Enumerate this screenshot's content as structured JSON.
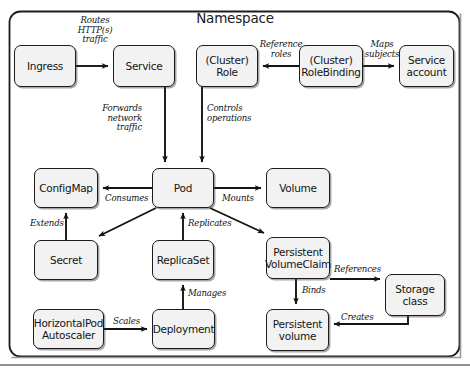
{
  "diagram": {
    "title": "Namespace",
    "colors": {
      "node_fill": "#f2f2f2",
      "node_border": "#1c1c1c",
      "arrow": "#141414",
      "background": "#ffffff"
    },
    "nodes": [
      {
        "id": "ingress",
        "label": "Ingress",
        "x": 14,
        "y": 45,
        "w": 62,
        "h": 42
      },
      {
        "id": "service",
        "label": "Service",
        "x": 113,
        "y": 45,
        "w": 62,
        "h": 42
      },
      {
        "id": "role",
        "label": "(Cluster)\nRole",
        "x": 196,
        "y": 45,
        "w": 62,
        "h": 42
      },
      {
        "id": "rolebinding",
        "label": "(Cluster)\nRoleBinding",
        "x": 299,
        "y": 45,
        "w": 64,
        "h": 42
      },
      {
        "id": "serviceaccount",
        "label": "Service\naccount",
        "x": 399,
        "y": 45,
        "w": 55,
        "h": 42
      },
      {
        "id": "configmap",
        "label": "ConfigMap",
        "x": 34,
        "y": 168,
        "w": 64,
        "h": 40
      },
      {
        "id": "pod",
        "label": "Pod",
        "x": 152,
        "y": 168,
        "w": 62,
        "h": 40
      },
      {
        "id": "volume",
        "label": "Volume",
        "x": 266,
        "y": 168,
        "w": 64,
        "h": 40
      },
      {
        "id": "secret",
        "label": "Secret",
        "x": 34,
        "y": 240,
        "w": 64,
        "h": 40
      },
      {
        "id": "replicaset",
        "label": "ReplicaSet",
        "x": 152,
        "y": 240,
        "w": 62,
        "h": 40
      },
      {
        "id": "pvc",
        "label": "Persistent\nVolumeClaim",
        "x": 266,
        "y": 237,
        "w": 64,
        "h": 42
      },
      {
        "id": "storageclass",
        "label": "Storage\nclass",
        "x": 385,
        "y": 274,
        "w": 60,
        "h": 42
      },
      {
        "id": "hpa",
        "label": "HorizontalPod\nAutoscaler",
        "x": 33,
        "y": 309,
        "w": 71,
        "h": 40
      },
      {
        "id": "deployment",
        "label": "Deployment",
        "x": 152,
        "y": 309,
        "w": 63,
        "h": 40
      },
      {
        "id": "pv",
        "label": "Persistent\nvolume",
        "x": 266,
        "y": 309,
        "w": 63,
        "h": 42
      }
    ],
    "edges": [
      {
        "id": "ingress-service",
        "label": "Routes\nHTTP(s)\ntraffic",
        "from": "ingress",
        "to": "service",
        "label_x": 95,
        "label_y": 16,
        "align": "center"
      },
      {
        "id": "rolebinding-role",
        "label": "Reference\nroles",
        "from": "rolebinding",
        "to": "role",
        "label_x": 281,
        "label_y": 40,
        "align": "center"
      },
      {
        "id": "rolebinding-sa",
        "label": "Maps\nsubjects",
        "from": "rolebinding",
        "to": "serviceaccount",
        "label_x": 382,
        "label_y": 40,
        "align": "center"
      },
      {
        "id": "service-pod",
        "label": "Forwards\nnetwork\ntraffic",
        "from": "service",
        "to": "pod",
        "label_x": 142,
        "label_y": 104,
        "align": "right"
      },
      {
        "id": "role-pod",
        "label": "Controls\noperations",
        "from": "role",
        "to": "pod",
        "label_x": 207,
        "label_y": 104,
        "align": "left"
      },
      {
        "id": "pod-configmap",
        "label": "Consumes",
        "from": "pod",
        "to": "configmap",
        "label_x": 105,
        "label_y": 194,
        "align": "left"
      },
      {
        "id": "pod-volume",
        "label": "Mounts",
        "from": "pod",
        "to": "volume",
        "label_x": 222,
        "label_y": 194,
        "align": "left"
      },
      {
        "id": "secret-configmap",
        "label": "Extends",
        "from": "secret",
        "to": "configmap",
        "label_x": 30,
        "label_y": 219,
        "align": "left"
      },
      {
        "id": "pod-secret",
        "label": "",
        "from": "pod",
        "to": "secret",
        "label_x": 0,
        "label_y": 0,
        "align": "left"
      },
      {
        "id": "replicaset-pod",
        "label": "Replicates",
        "from": "replicaset",
        "to": "pod",
        "label_x": 188,
        "label_y": 219,
        "align": "left"
      },
      {
        "id": "pod-pvc",
        "label": "",
        "from": "pod",
        "to": "pvc",
        "label_x": 0,
        "label_y": 0,
        "align": "left"
      },
      {
        "id": "pvc-storageclass",
        "label": "References",
        "from": "pvc",
        "to": "storageclass",
        "label_x": 334,
        "label_y": 265,
        "align": "left"
      },
      {
        "id": "pvc-pv",
        "label": "Binds",
        "from": "pvc",
        "to": "pv",
        "label_x": 302,
        "label_y": 286,
        "align": "left"
      },
      {
        "id": "storageclass-pv",
        "label": "Creates",
        "from": "storageclass",
        "to": "pv",
        "label_x": 341,
        "label_y": 313,
        "align": "left"
      },
      {
        "id": "deployment-replicaset",
        "label": "Manages",
        "from": "deployment",
        "to": "replicaset",
        "label_x": 188,
        "label_y": 289,
        "align": "left"
      },
      {
        "id": "hpa-deployment",
        "label": "Scales",
        "from": "hpa",
        "to": "deployment",
        "label_x": 113,
        "label_y": 317,
        "align": "left"
      }
    ]
  }
}
